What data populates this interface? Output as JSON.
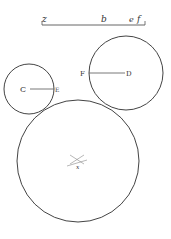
{
  "diagram": {
    "type": "geometric construction — three mutually tangent circles",
    "stroke_color": "#444444",
    "background": "#ffffff",
    "scale_line": {
      "labels": [
        "z",
        "b",
        "e",
        "f"
      ]
    },
    "circles": [
      {
        "id": "C",
        "center_label": "C",
        "radius_end_label": "E",
        "cx": 29,
        "cy": 89,
        "r": 25
      },
      {
        "id": "D",
        "center_label": "D",
        "radius_end_label": "F",
        "cx": 126,
        "cy": 73,
        "r": 37
      },
      {
        "id": "large",
        "center_label": "x",
        "cx": 78,
        "cy": 161,
        "r": 61
      }
    ]
  }
}
